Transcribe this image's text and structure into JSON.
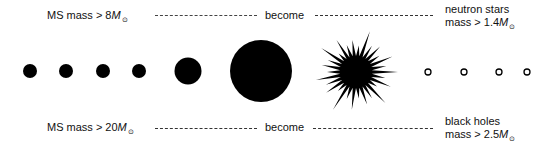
{
  "top_row": {
    "left_label": "MS mass > 8",
    "left_mass_symbol": "M",
    "middle_label": "become",
    "right_label_line1": "neutron stars",
    "right_label_line2": "mass > 1.4",
    "right_mass_symbol": "M"
  },
  "bottom_row": {
    "left_label": "MS mass > 20",
    "left_mass_symbol": "M",
    "middle_label": "become",
    "right_label_line1": "black holes",
    "right_label_line2": "mass > 2.5",
    "right_mass_symbol": "M"
  },
  "sun_symbol": "⊙",
  "objects": {
    "small_dots_count": 4,
    "medium_circle": 1,
    "large_circle": 1,
    "starburst": 1,
    "hollow_circles_count": 4
  },
  "colors": {
    "ink": "#000000",
    "background": "#ffffff"
  }
}
